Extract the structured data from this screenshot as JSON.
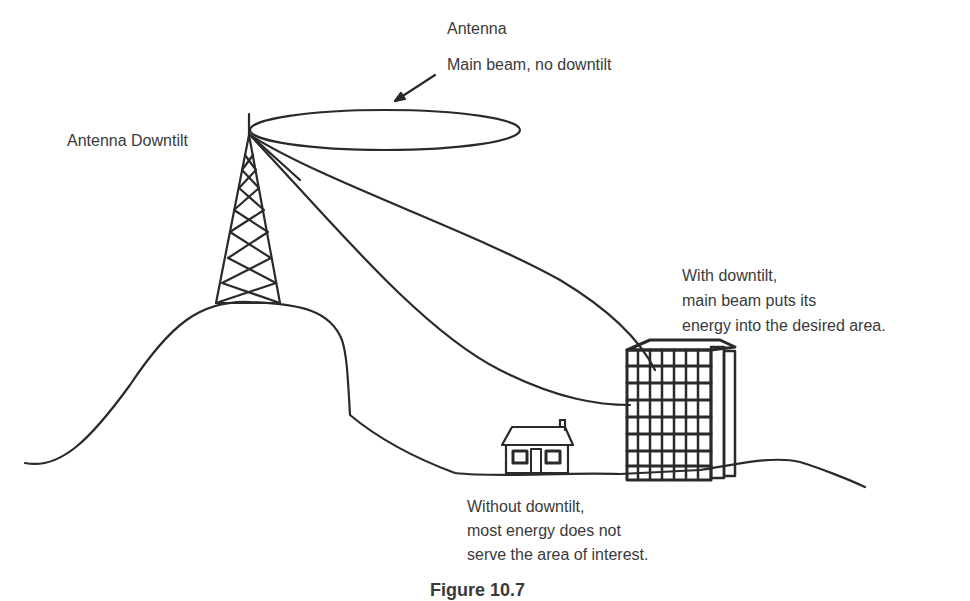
{
  "diagram": {
    "labels": {
      "antenna": "Antenna",
      "main_beam_no_downtilt": "Main beam, no downtilt",
      "antenna_downtilt": "Antenna Downtilt",
      "with_downtilt": [
        "With downtilt,",
        "main beam puts its",
        "energy into the desired area."
      ],
      "without_downtilt": [
        "Without downtilt,",
        "most energy does not",
        "serve the area of interest."
      ]
    },
    "caption": "Figure 10.7",
    "elements": [
      "lattice-tower",
      "antenna-beam-no-downtilt",
      "antenna-beam-with-downtilt",
      "hill",
      "house",
      "office-building",
      "arrow"
    ],
    "colors": {
      "line": "#2a2a2a",
      "text": "#3a3a3a",
      "background": "#ffffff"
    }
  }
}
